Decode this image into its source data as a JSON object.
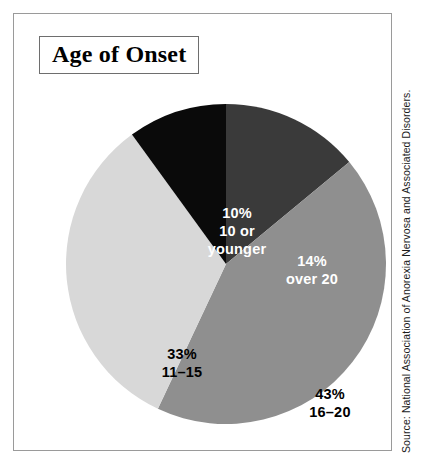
{
  "figure": {
    "title": "Age of Onset",
    "source": "Source: National Association of Anorexia Nervosa and Associated Disorders."
  },
  "colors": {
    "slice_over_20": "#3a3a3a",
    "slice_16_20": "#8f8f8f",
    "slice_11_15": "#d8d8d8",
    "slice_10_or_younger": "#0a0a0a",
    "frame_border": "#9a9a9a",
    "title_border": "#6e6e6e",
    "label_on_dark": "#ffffff",
    "label_on_light": "#000000",
    "background": "#ffffff"
  },
  "labels": {
    "over_20": {
      "percent": "14%",
      "range": "over 20"
    },
    "age_16_20": {
      "percent": "43%",
      "range": "16–20"
    },
    "age_11_15": {
      "percent": "33%",
      "range": "11–15"
    },
    "ten_or_younger": {
      "percent": "10%",
      "range_line1": "10 or",
      "range_line2": "younger"
    }
  },
  "chart_data": {
    "type": "pie",
    "title": "Age of Onset",
    "subtitle": "",
    "xlabel": "",
    "ylabel": "",
    "legend": "none",
    "start_angle_deg": 0,
    "direction": "clockwise",
    "labels_inside_slices": true,
    "units": "percent",
    "categories": [
      "over 20",
      "16–20",
      "11–15",
      "10 or younger"
    ],
    "values": [
      14,
      43,
      33,
      10
    ],
    "slices": [
      {
        "label": "over 20",
        "value": 14,
        "display": "14%",
        "color": "#3a3a3a",
        "text_color": "#ffffff"
      },
      {
        "label": "16–20",
        "value": 43,
        "display": "43%",
        "color": "#8f8f8f",
        "text_color": "#000000"
      },
      {
        "label": "11–15",
        "value": 33,
        "display": "33%",
        "color": "#d8d8d8",
        "text_color": "#000000"
      },
      {
        "label": "10 or younger",
        "value": 10,
        "display": "10%",
        "color": "#0a0a0a",
        "text_color": "#ffffff"
      }
    ],
    "annotations": [
      "Source: National Association of Anorexia Nervosa and Associated Disorders."
    ]
  }
}
